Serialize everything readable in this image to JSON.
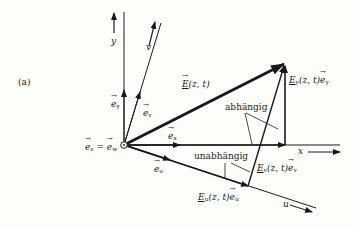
{
  "figure": {
    "panel_label": "(a)",
    "axes": {
      "y_label": "y",
      "v_label": "v",
      "x_label": "x",
      "u_label": "u"
    },
    "unit_vectors": {
      "e_y": "e",
      "e_y_sub": "y",
      "e_v": "e",
      "e_v_sub": "v",
      "e_x": "e",
      "e_x_sub": "x",
      "e_u": "e",
      "e_u_sub": "u",
      "e_z_eq_e_w": {
        "left": "e",
        "left_sub": "z",
        "equals": "=",
        "right": "e",
        "right_sub": "w"
      }
    },
    "vectors": {
      "E_total": {
        "symbol": "E",
        "args": "(z, t)"
      },
      "E_y_component": {
        "symbol": "E",
        "sub": "y",
        "args": "(z, t)",
        "unit": "e",
        "unit_sub": "y"
      },
      "E_v_component": {
        "symbol": "E",
        "sub": "v",
        "args": "(z, t)",
        "unit": "e",
        "unit_sub": "v"
      },
      "E_u_component": {
        "symbol": "E",
        "sub": "u",
        "args": "(z, t)",
        "unit": "e",
        "unit_sub": "u"
      }
    },
    "annotations": {
      "dependent": "abhängig",
      "independent": "unabhängig"
    },
    "colors": {
      "ink": "#1a1a1a",
      "paper": "#fdfdf9"
    }
  }
}
